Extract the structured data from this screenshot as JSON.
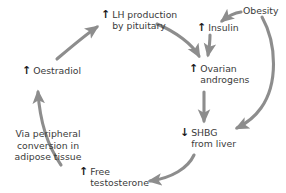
{
  "diagram": {
    "arrow_color": "#8d8d8d",
    "text_color": "#3a3a3a",
    "glyph_color": "#1c1c1c",
    "background": "#ffffff",
    "nodes": [
      {
        "id": "lh",
        "glyph": "↑",
        "label": "LH production\nby pituitary"
      },
      {
        "id": "obesity",
        "glyph": "",
        "label": "Obesity"
      },
      {
        "id": "insulin",
        "glyph": "↑",
        "label": "Insulin"
      },
      {
        "id": "oestradiol",
        "glyph": "↑",
        "label": "Oestradiol"
      },
      {
        "id": "ovarian",
        "glyph": "↑",
        "label": "Ovarian\nandrogens"
      },
      {
        "id": "shbg",
        "glyph": "↓",
        "label": "SHBG\nfrom liver"
      },
      {
        "id": "free-testosterone",
        "glyph": "↑",
        "label": "Free\ntestosterone"
      }
    ],
    "annotations": [
      {
        "id": "via-peripheral",
        "text": "Via peripheral\nconversion in\nadipose tissue"
      }
    ],
    "edges": [
      {
        "from": "oestradiol",
        "to": "lh"
      },
      {
        "from": "lh",
        "to": "ovarian"
      },
      {
        "from": "obesity",
        "to": "insulin"
      },
      {
        "from": "insulin",
        "to": "ovarian"
      },
      {
        "from": "obesity",
        "to": "shbg"
      },
      {
        "from": "ovarian",
        "to": "shbg"
      },
      {
        "from": "shbg",
        "to": "free-testosterone"
      },
      {
        "from": "free-testosterone",
        "to": "oestradiol"
      }
    ]
  }
}
